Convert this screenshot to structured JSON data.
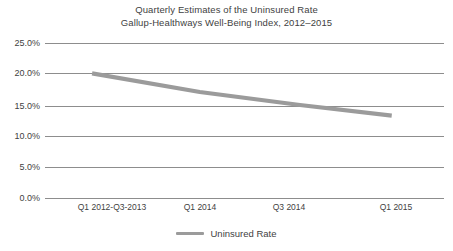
{
  "chart_data": {
    "type": "line",
    "title": "Quarterly Estimates of the Uninsured Rate",
    "subtitle": "Gallup-Healthways Well-Being Index, 2012–2015",
    "xlabel": "",
    "ylabel": "",
    "ylim": [
      0,
      25
    ],
    "ytick_labels": [
      "25.0%",
      "20.0%",
      "15.0%",
      "10.0%",
      "5.0%",
      "0.0%"
    ],
    "ytick_values": [
      25,
      20,
      15,
      10,
      5,
      0
    ],
    "xtick_labels": [
      "Q1 2012-Q3-2013",
      "Q1 2014",
      "Q3 2014",
      "Q1 2015"
    ],
    "grid": true,
    "legend_position": "bottom",
    "series": [
      {
        "name": "Uninsured Rate",
        "color": "#9b9b9b",
        "x": [
          "Q1 2012-Q3-2013",
          "Q1 2014",
          "Q3 2014",
          "Q1 2015"
        ],
        "values": [
          20.1,
          17.1,
          15.0,
          13.3
        ],
        "points": [
          {
            "x_frac": 0.118,
            "value": 20.1
          },
          {
            "x_frac": 0.388,
            "value": 17.1
          },
          {
            "x_frac": 0.639,
            "value": 15.0
          },
          {
            "x_frac": 0.869,
            "value": 13.3
          }
        ]
      }
    ]
  },
  "axis": {
    "y_labels": [
      {
        "text": "25.0%",
        "top": 39
      },
      {
        "text": "20.0%",
        "top": 69
      },
      {
        "text": "15.0%",
        "top": 102
      },
      {
        "text": "10.0%",
        "top": 132
      },
      {
        "text": "5.0%",
        "top": 163
      },
      {
        "text": "0.0%",
        "top": 194
      }
    ],
    "x_labels": [
      {
        "text": "Q1 2012-Q3-2013",
        "left": 112
      },
      {
        "text": "Q1 2014",
        "left": 200
      },
      {
        "text": "Q3 2014",
        "left": 289
      },
      {
        "text": "Q1 2015",
        "left": 396
      }
    ],
    "gridline_color": "#8d8d8d"
  },
  "legend": {
    "label": "Uninsured Rate",
    "color": "#9b9b9b"
  }
}
